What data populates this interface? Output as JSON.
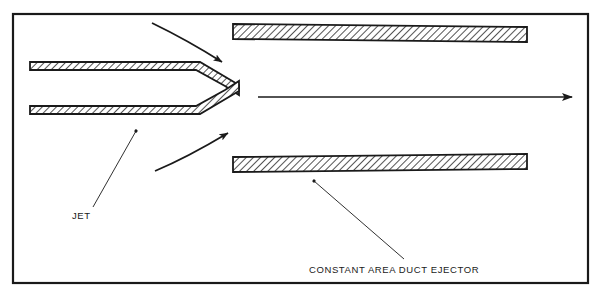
{
  "figure": {
    "background_color": "#ffffff",
    "line_color": "#1a1a1a",
    "hatch_color": "#1a1a1a",
    "border": {
      "name": "figure-border",
      "x": 13,
      "y": 14,
      "width": 575,
      "height": 269,
      "stroke_width": 2.2
    },
    "labels": [
      {
        "id": "jet",
        "text": "JET",
        "x": 72,
        "y": 219,
        "anchor": "start"
      },
      {
        "id": "ejector",
        "text": "CONSTANT AREA DUCT EJECTOR",
        "x": 309,
        "y": 273,
        "anchor": "start"
      }
    ],
    "leaders": [
      {
        "id": "jet-leader",
        "from_x": 93,
        "from_y": 207,
        "to_x": 137,
        "to_y": 130
      },
      {
        "id": "ejector-leader",
        "from_x": 404,
        "from_y": 259,
        "to_x": 313,
        "to_y": 180
      }
    ],
    "parts": [
      {
        "id": "nozzle-upper-wall",
        "name": "nozzle-upper-wall",
        "outline": "M 30,62 L 200,62 L 239,85 L 239,95 L 225,86 L 196,70 L 30,70 Z"
      },
      {
        "id": "nozzle-lower-wall",
        "name": "nozzle-lower-wall",
        "outline": "M 30,106 L 196,106 L 225,90 L 239,81 L 239,91 L 200,114 L 30,114 Z"
      },
      {
        "id": "duct-upper-wall",
        "name": "duct-upper-wall",
        "outline": "M 233,24 L 527,27 L 527,42 L 233,39 Z"
      },
      {
        "id": "duct-lower-wall",
        "name": "duct-lower-wall",
        "outline": "M 233,157 L 527,154 L 527,169 L 233,172 Z"
      }
    ],
    "flow_arrows": [
      {
        "id": "center-flow-arrow",
        "name": "center-flow-arrow",
        "type": "straight",
        "from_x": 258,
        "from_y": 97,
        "to_x": 578,
        "to_y": 97
      },
      {
        "id": "upper-entrainment-arrow",
        "name": "upper-entrainment-arrow",
        "type": "curved",
        "path": "M 152,23 C 183,38 203,50 224,63"
      },
      {
        "id": "lower-entrainment-arrow",
        "name": "lower-entrainment-arrow",
        "type": "curved",
        "path": "M 155,171 C 186,158 208,145 230,132"
      }
    ]
  }
}
